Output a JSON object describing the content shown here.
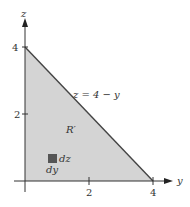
{
  "diagram": {
    "axes": {
      "horizontal": "y",
      "vertical": "z"
    },
    "ticks": {
      "y": [
        "2",
        "4"
      ],
      "z": [
        "2",
        "4"
      ]
    },
    "region_label": "R′",
    "boundary_label": "z = 4 − y",
    "element_labels": {
      "dz": "dz",
      "dy": "dy"
    },
    "colors": {
      "region_fill": "#d4d4d4",
      "element": "#555555",
      "axis": "#333333"
    }
  }
}
